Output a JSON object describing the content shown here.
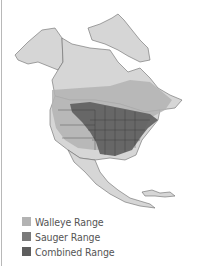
{
  "map": {
    "subject": "North America fish range map",
    "colors": {
      "land": "#d6d6d6",
      "border": "#6a6a6a",
      "water": "#ffffff",
      "walleye": "#b3b3b3",
      "sauger": "#7a7a7a",
      "combined": "#5e5e5e"
    }
  },
  "legend": {
    "items": [
      {
        "label": "Walleye Range",
        "color": "#b3b3b3"
      },
      {
        "label": "Sauger Range",
        "color": "#7a7a7a"
      },
      {
        "label": "Combined Range",
        "color": "#5e5e5e"
      }
    ]
  }
}
